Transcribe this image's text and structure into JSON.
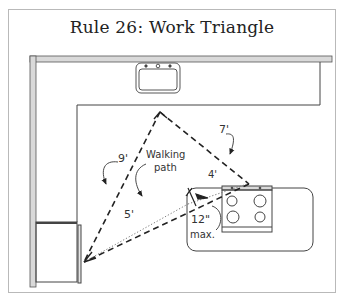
{
  "title": "Rule 26: Work Triangle",
  "labels": {
    "sink_to_fridge": "9'",
    "sink_to_stove": "7'",
    "walking_path_line1": "Walking",
    "walking_path_line2": "path",
    "walking_to_stove": "4'",
    "walking_to_fridge": "5'",
    "landing_distance": "12\"",
    "landing_max": "max."
  },
  "elements": {
    "sink": "sink",
    "refrigerator": "refrigerator",
    "stove": "stove",
    "island": "island",
    "counter": "L-shaped counter"
  },
  "colors": {
    "line": "#333333",
    "wall_fill": "#d9d9d9",
    "frame_border": "#b9b9b9"
  }
}
